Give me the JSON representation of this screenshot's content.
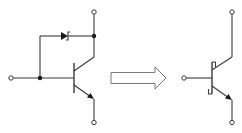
{
  "diagram": {
    "title": "Schottky-clamped transistor equivalent to Schottky transistor symbol",
    "left_circuit": {
      "label": "BJT with Schottky diode clamp between base and collector",
      "components": [
        "npn-transistor",
        "schottky-diode"
      ],
      "terminals": [
        "base",
        "collector",
        "emitter"
      ]
    },
    "transform_arrow": {
      "label": "equivalent to"
    },
    "right_symbol": {
      "label": "Schottky transistor symbol",
      "terminals": [
        "base",
        "collector",
        "emitter"
      ]
    },
    "colors": {
      "line": "#3a3a3a",
      "dot": "#1a1a1a",
      "arrow_outline": "#6a6a6a",
      "background": "#ffffff"
    }
  }
}
